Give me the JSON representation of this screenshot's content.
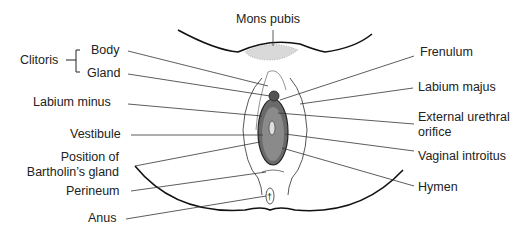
{
  "diagram": {
    "type": "anatomical-labeled-illustration",
    "labels_left": {
      "clitoris": "Clitoris",
      "body": "Body",
      "gland": "Gland",
      "labium_minus": "Labium minus",
      "vestibule": "Vestibule",
      "bartholin_line1": "Position of",
      "bartholin_line2": "Bartholin’s gland",
      "perineum": "Perineum",
      "anus": "Anus"
    },
    "labels_top": {
      "mons_pubis": "Mons pubis"
    },
    "labels_right": {
      "frenulum": "Frenulum",
      "labium_majus": "Labium majus",
      "urethral_line1": "External urethral",
      "urethral_line2": "orifice",
      "vaginal_introitus": "Vaginal introitus",
      "hymen": "Hymen"
    }
  }
}
